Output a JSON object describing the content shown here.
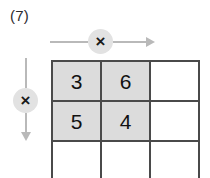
{
  "problem": {
    "label": "(7)"
  },
  "operators": {
    "column_operator": "×",
    "row_operator": "×"
  },
  "colors": {
    "shaded_cell": "#dcdcdc",
    "grid_line": "#4a4a4a",
    "arrow": "#b9b9b9",
    "badge": "#e2e2e2",
    "text": "#111111",
    "background": "#ffffff"
  },
  "grid": {
    "rows": 3,
    "columns": 3,
    "cells": [
      [
        {
          "value": "3",
          "shaded": true
        },
        {
          "value": "6",
          "shaded": true
        },
        {
          "value": "",
          "shaded": false
        }
      ],
      [
        {
          "value": "5",
          "shaded": true
        },
        {
          "value": "4",
          "shaded": true
        },
        {
          "value": "",
          "shaded": false
        }
      ],
      [
        {
          "value": "",
          "shaded": false
        },
        {
          "value": "",
          "shaded": false
        },
        {
          "value": "",
          "shaded": false
        }
      ]
    ]
  }
}
